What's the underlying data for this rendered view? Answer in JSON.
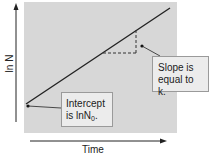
{
  "diagram": {
    "type": "semi-log growth plot",
    "axes": {
      "x_label": "Time",
      "y_label": "ln N"
    },
    "callouts": {
      "intercept": {
        "line1": "Intercept",
        "line2_prefix": "is lnN",
        "line2_sub": "0",
        "line2_suffix": "."
      },
      "slope": {
        "line1": "Slope is",
        "line2": "equal to k."
      }
    },
    "colors": {
      "plot_background": "#d7d7d7",
      "line": "#222222",
      "callout_background": "#ececec"
    }
  }
}
